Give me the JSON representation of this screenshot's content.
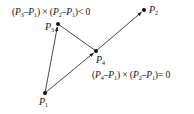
{
  "diagram": {
    "points": [
      {
        "id": "P1",
        "name": "P",
        "sub": "1",
        "x": 45,
        "y": 93
      },
      {
        "id": "P2",
        "name": "P",
        "sub": "2",
        "x": 144,
        "y": 10
      },
      {
        "id": "P3",
        "name": "P",
        "sub": "3",
        "x": 58,
        "y": 24
      },
      {
        "id": "P4",
        "name": "P",
        "sub": "4",
        "x": 96,
        "y": 51
      }
    ],
    "edges": [
      {
        "from": "P1",
        "to": "P3",
        "arrow": true
      },
      {
        "from": "P3",
        "to": "P4",
        "arrow": false
      },
      {
        "from": "P1",
        "to": "P4",
        "arrow": true
      },
      {
        "from": "P4",
        "to": "P2",
        "arrow": true
      }
    ],
    "equations": {
      "cross_negative": {
        "a_name": "P",
        "a_sub1": "3",
        "a_sub2": "1",
        "b_name": "P",
        "b_sub1": "2",
        "b_sub2": "1",
        "operator": "×",
        "relation": "< 0"
      },
      "cross_zero": {
        "a_name": "P",
        "a_sub1": "4",
        "a_sub2": "1",
        "b_name": "P",
        "b_sub1": "2",
        "b_sub2": "1",
        "operator": "×",
        "relation": "= 0"
      }
    },
    "colors": {
      "stroke": "#222222",
      "text": "#111111",
      "background": "#ffffff"
    }
  }
}
